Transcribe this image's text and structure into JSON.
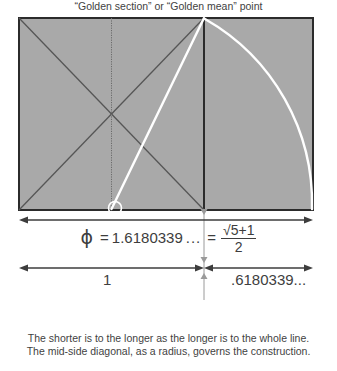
{
  "figure": {
    "title_alt": "Golden ratio construction diagram",
    "colors": {
      "background": "#ffffff",
      "rect_fill": "#a9a9a9",
      "rect_stroke": "#2b2b2b",
      "diagonal_stroke": "#4a4a4a",
      "construction_white": "#ffffff",
      "dimension_line": "#3d3d3d",
      "text": "#3f3f3f"
    },
    "geometry": {
      "rect_left": 19,
      "rect_top": 18,
      "rect_right": 313,
      "rect_bottom": 210,
      "square_divider_x": 204,
      "square_center_x": 111.5,
      "square_center_y": 114,
      "golden_point_x": 204,
      "arc_start": [
        204,
        18
      ],
      "arc_end": [
        313,
        210
      ],
      "radius_line_start": [
        111.5,
        210
      ],
      "radius_line_end": [
        204,
        18
      ],
      "marker_circle": [
        115,
        208
      ],
      "dim_line_full_y": 220,
      "dim_line_split_y": 268
    }
  },
  "formula": {
    "phi_symbol": "ϕ",
    "equals": "=",
    "decimal_value": "1.6180339",
    "ellipsis": "...",
    "numerator": "√5+1",
    "denominator": "2"
  },
  "dimensions": {
    "left_segment_label": "1",
    "right_segment_label": ".6180339...",
    "full_span_described": "ϕ = 1.6180339 ... = √5+1 / 2"
  },
  "annotations": {
    "golden_point": "“Golden section” or “Golden mean” point",
    "caption_line_1": "The shorter is to the longer as the longer is to the whole line.",
    "caption_line_2": "The mid-side diagonal, as a radius, governs the construction."
  }
}
